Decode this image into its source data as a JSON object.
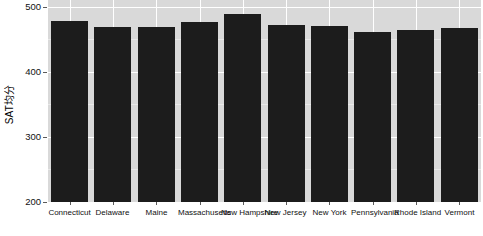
{
  "chart_data": {
    "type": "bar",
    "title": "",
    "subtitle": "",
    "xlabel": "",
    "ylabel": "SAT均分",
    "categories": [
      "Connecticut",
      "Delaware",
      "Maine",
      "Massachusetts",
      "New Hampshire",
      "New Jersey",
      "New York",
      "Pennsylvania",
      "Rhode Island",
      "Vermont"
    ],
    "values": [
      478,
      469,
      468,
      477,
      488,
      472,
      470,
      461,
      464,
      467
    ],
    "ylim": [
      200,
      510
    ],
    "yticks": [
      200,
      300,
      400,
      500
    ],
    "ytick_labels": [
      "200",
      "300",
      "400",
      "500"
    ],
    "grid": "major-white-on-gray-panel",
    "legend": "none",
    "legend_position": "none",
    "bar_color": "#1C1C1C",
    "panel_color": "#D9D9D9",
    "gridline_color": "#FFFFFF",
    "page_background": "#FFFFFF",
    "annotations": []
  }
}
